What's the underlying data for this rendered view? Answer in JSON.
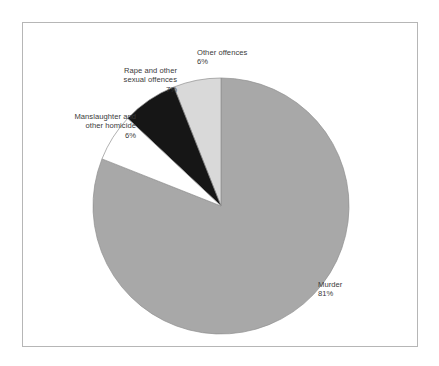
{
  "chart_data": {
    "type": "pie",
    "title": "",
    "subtitle": "",
    "xlabel": "",
    "ylabel": "",
    "legend_position": "none",
    "grid": false,
    "unit": "%",
    "start_angle_deg": 0,
    "direction": "clockwise",
    "categories": [
      "Murder",
      "Other offences",
      "Rape and other sexual offences",
      "Manslaughter and other homicide"
    ],
    "values": [
      81,
      6,
      7,
      6
    ],
    "slices": [
      {
        "label": "Murder",
        "label_line1": "Murder",
        "value": 81,
        "value_text": "81%",
        "color": "#a8a8a8",
        "start_deg": 0,
        "end_deg": 291.6,
        "label_align": "left"
      },
      {
        "label": "Other offences",
        "label_line1": "Other offences",
        "value": 6,
        "value_text": "6%",
        "color": "#d9d9d9",
        "start_deg": 338.4,
        "end_deg": 360,
        "label_align": "left"
      },
      {
        "label": "Rape and other sexual offences",
        "label_line1": "Rape and other",
        "label_line2": "sexual offences",
        "value": 7,
        "value_text": "7%",
        "color": "#161616",
        "start_deg": 313.2,
        "end_deg": 338.4,
        "label_align": "right"
      },
      {
        "label": "Manslaughter and other homicide",
        "label_line1": "Manslaughter and",
        "label_line2": "other homicide",
        "value": 6,
        "value_text": "6%",
        "color": "#ffffff",
        "start_deg": 291.6,
        "end_deg": 313.2,
        "label_align": "right"
      }
    ],
    "colors": {
      "murder": "#a8a8a8",
      "other_offences": "#d9d9d9",
      "rape_and_other_sexual_offences": "#161616",
      "manslaughter_and_other_homicide": "#ffffff",
      "slice_outline": "#8f8f8f",
      "leader_line": "#9a9a9a",
      "frame_border": "#b6b6b6",
      "text": "#3a3a3a",
      "background": "#ffffff"
    },
    "geometry": {
      "center_x": 221,
      "center_y": 206,
      "radius": 128
    }
  }
}
